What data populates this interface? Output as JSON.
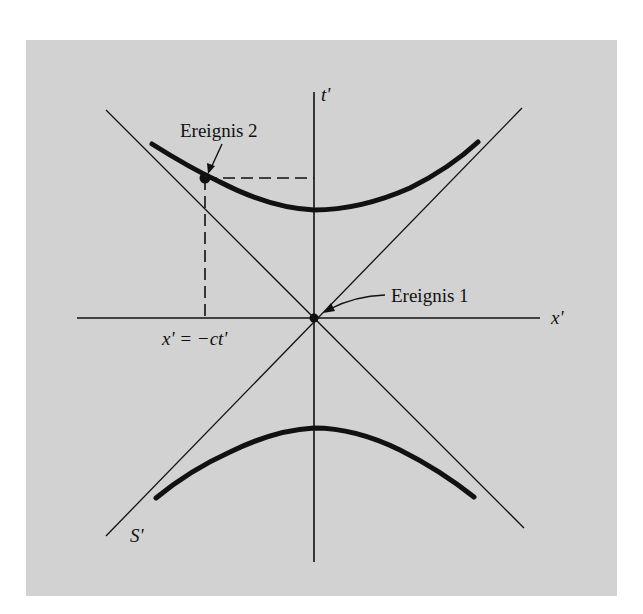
{
  "diagram": {
    "type": "spacetime-diagram",
    "frame_label": "S'",
    "axes": {
      "x_label": "x'",
      "t_label": "t'"
    },
    "events": [
      {
        "id": "event-1",
        "label": "Ereignis 1",
        "position": "origin"
      },
      {
        "id": "event-2",
        "label": "Ereignis 2",
        "position": "upper-left branch of hyperbola"
      }
    ],
    "projection_label": "x' = −ct'",
    "elements": [
      "light-cone line x' = ct'",
      "light-cone line x' = −ct'",
      "upper hyperbola branch",
      "lower hyperbola branch",
      "dashed projection from Ereignis 2 to x' axis",
      "dashed projection from Ereignis 2 to t' axis"
    ]
  },
  "colors": {
    "panel_background": "#d2d2d2",
    "page_background": "#ffffff",
    "ink": "#111111"
  }
}
